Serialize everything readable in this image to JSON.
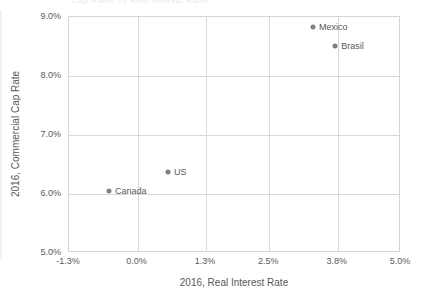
{
  "chart_data": {
    "type": "scatter",
    "title": "",
    "clipped_header_text": "Cap Rates vs Real Interest Rates",
    "xlabel": "2016, Real Interest Rate",
    "ylabel": "2016, Commercial Cap Rate",
    "xlim": [
      -1.3,
      5.0
    ],
    "ylim": [
      5.0,
      9.0
    ],
    "grid": true,
    "legend": "none",
    "point_color": "#7f7f7f",
    "grid_color": "#d9d9d9",
    "axis_color": "#d5d5d5",
    "text_color": "#595959",
    "xticks": [
      "-1.3%",
      "0.0%",
      "1.3%",
      "2.5%",
      "3.8%",
      "5.0%"
    ],
    "xtick_values": [
      -1.3,
      0.0,
      1.3,
      2.5,
      3.8,
      5.0
    ],
    "yticks": [
      "9.0%",
      "8.0%",
      "7.0%",
      "6.0%",
      "5.0%"
    ],
    "ytick_values": [
      9.0,
      8.0,
      7.0,
      6.0,
      5.0
    ],
    "points": [
      {
        "label": "Mexico",
        "x": 3.33,
        "y": 8.83,
        "label_side": "right"
      },
      {
        "label": "Brasil",
        "x": 3.75,
        "y": 8.51,
        "label_side": "right"
      },
      {
        "label": "US",
        "x": 0.58,
        "y": 6.37,
        "label_side": "right"
      },
      {
        "label": "Canada",
        "x": -0.54,
        "y": 6.05,
        "label_side": "right"
      }
    ]
  }
}
